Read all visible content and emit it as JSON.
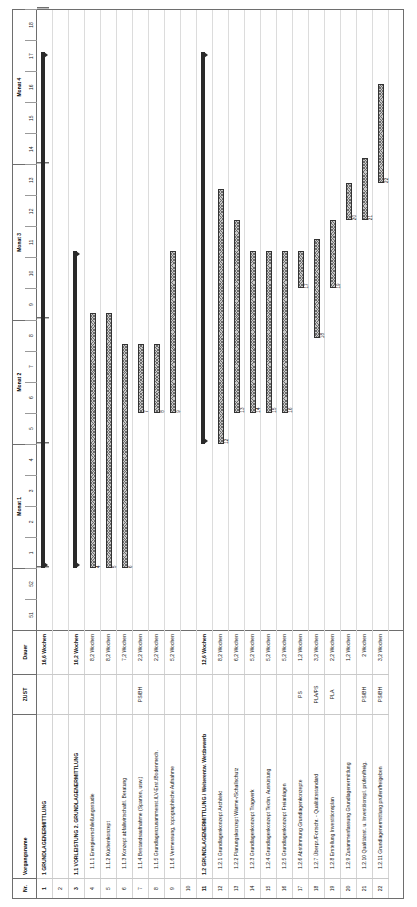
{
  "document": {
    "type": "gantt-chart",
    "orientation": "landscape-rotated-90ccw",
    "language": "de"
  },
  "table": {
    "headers": {
      "nr": "Nr.",
      "vorgangsname": "Vorgangsname",
      "zust": "ZUST",
      "dauer": "Dauer"
    }
  },
  "timeline": {
    "months": [
      {
        "label": "",
        "weeks": 2
      },
      {
        "label": "Monat 1",
        "weeks": 4
      },
      {
        "label": "Monat 2",
        "weeks": 4
      },
      {
        "label": "Monat 3",
        "weeks": 5
      },
      {
        "label": "Monat 4",
        "weeks": 5
      }
    ],
    "weeks": [
      "51",
      "52",
      "1",
      "2",
      "3",
      "4",
      "5",
      "6",
      "7",
      "8",
      "9",
      "10",
      "11",
      "12",
      "13",
      "14",
      "15",
      "16",
      "17",
      "18"
    ]
  },
  "rows": [
    {
      "nr": "1",
      "name": "1 GRUNDLAGENERMITTLUNG",
      "zust": "",
      "dauer": "16,6 Wochen",
      "level": 0,
      "bold": true,
      "bar": {
        "type": "summary",
        "start": 2.0,
        "end": 18.6,
        "label": ""
      }
    },
    {
      "nr": "2",
      "name": "",
      "zust": "",
      "dauer": "",
      "level": 0,
      "bold": false,
      "bar": null
    },
    {
      "nr": "3",
      "name": "1.1 VORLEISTUNG  2. GRUNDLAGENERMITTLUNG",
      "zust": "",
      "dauer": "10,2 Wochen",
      "level": 0,
      "bold": true,
      "bar": {
        "type": "summary",
        "start": 2.0,
        "end": 12.2,
        "label": ""
      }
    },
    {
      "nr": "4",
      "name": "1.1.1 Energieerschließungsstudie",
      "zust": "",
      "dauer": "8,2 Wochen",
      "level": 1,
      "bold": false,
      "bar": {
        "type": "task",
        "start": 2.0,
        "end": 10.2,
        "label": "4"
      }
    },
    {
      "nr": "5",
      "name": "1.1.2 Küchenkonzept",
      "zust": "",
      "dauer": "8,2 Wochen",
      "level": 1,
      "bold": false,
      "bar": {
        "type": "task",
        "start": 2.0,
        "end": 10.2,
        "label": "5"
      }
    },
    {
      "nr": "6",
      "name": "1.1.3 Konzept abfallwirtschaftl. Beratung",
      "zust": "",
      "dauer": "7,2 Wochen",
      "level": 1,
      "bold": false,
      "bar": {
        "type": "task",
        "start": 2.0,
        "end": 9.2,
        "label": "6"
      }
    },
    {
      "nr": "7",
      "name": "1.1.4 Bestandsaufnahme (Sparten, usw.)",
      "zust": "PS/BH",
      "dauer": "2,2 Wochen",
      "level": 1,
      "bold": false,
      "bar": {
        "type": "task",
        "start": 7.0,
        "end": 9.2,
        "label": "7"
      }
    },
    {
      "nr": "8",
      "name": "1.1.5 Grundlagenzusammenst./LV-Erst./Bodenmech.",
      "zust": "",
      "dauer": "2,2 Wochen",
      "level": 1,
      "bold": false,
      "bar": {
        "type": "task",
        "start": 7.0,
        "end": 9.2,
        "label": "8"
      }
    },
    {
      "nr": "9",
      "name": "1.1.6 Vermessung, topographische Aufnahme",
      "zust": "",
      "dauer": "5,2 Wochen",
      "level": 1,
      "bold": false,
      "bar": {
        "type": "task",
        "start": 7.0,
        "end": 12.2,
        "label": "9"
      }
    },
    {
      "nr": "10",
      "name": "",
      "zust": "",
      "dauer": "",
      "level": 0,
      "bold": false,
      "bar": null
    },
    {
      "nr": "11",
      "name": "1.2 GRUNDLAGENERMITTLUNG / Weiterentw. Wettbewerb",
      "zust": "",
      "dauer": "12,6 Wochen",
      "level": 0,
      "bold": true,
      "bar": {
        "type": "summary",
        "start": 6.0,
        "end": 18.6,
        "label": ""
      }
    },
    {
      "nr": "12",
      "name": "1.2.1 Grundlagenkonzept Architekt",
      "zust": "",
      "dauer": "8,2 Wochen",
      "level": 1,
      "bold": false,
      "bar": {
        "type": "task",
        "start": 6.0,
        "end": 14.2,
        "label": "12"
      }
    },
    {
      "nr": "13",
      "name": "1.2.2 Planungskonzept Wärme-/Schallschutz",
      "zust": "",
      "dauer": "6,2 Wochen",
      "level": 1,
      "bold": false,
      "bar": {
        "type": "task",
        "start": 7.0,
        "end": 13.2,
        "label": "13"
      }
    },
    {
      "nr": "14",
      "name": "1.2.3 Grundlagenkonzept Tragwerk",
      "zust": "",
      "dauer": "5,2 Wochen",
      "level": 1,
      "bold": false,
      "bar": {
        "type": "task",
        "start": 7.0,
        "end": 12.2,
        "label": "14"
      }
    },
    {
      "nr": "15",
      "name": "1.2.4 Grundlagenkonzept Techn. Ausrüstung",
      "zust": "",
      "dauer": "5,2 Wochen",
      "level": 1,
      "bold": false,
      "bar": {
        "type": "task",
        "start": 7.0,
        "end": 12.2,
        "label": "15"
      }
    },
    {
      "nr": "16",
      "name": "1.2.5 Grundlagenkonzept Freianlagen",
      "zust": "",
      "dauer": "5,2 Wochen",
      "level": 1,
      "bold": false,
      "bar": {
        "type": "task",
        "start": 7.0,
        "end": 12.2,
        "label": "16"
      }
    },
    {
      "nr": "17",
      "name": "1.2.6 Abstimmung Grundlagenkonzepte",
      "zust": "PS",
      "dauer": "1,2 Wochen",
      "level": 1,
      "bold": false,
      "bar": {
        "type": "task",
        "start": 11.0,
        "end": 12.2,
        "label": "17"
      }
    },
    {
      "nr": "18",
      "name": "1.2.7 Überpr./Fortschr. - Qualitätsstandard",
      "zust": "PLA/PS",
      "dauer": "3,2 Wochen",
      "level": 1,
      "bold": false,
      "bar": {
        "type": "task",
        "start": 9.4,
        "end": 12.6,
        "label": "18"
      }
    },
    {
      "nr": "19",
      "name": "1.2.8 Erstellung Investitionsplan",
      "zust": "PLA",
      "dauer": "2,2 Wochen",
      "level": 1,
      "bold": false,
      "bar": {
        "type": "task",
        "start": 11.0,
        "end": 13.2,
        "label": "19"
      }
    },
    {
      "nr": "20",
      "name": "1.2.9 Zusammenfassung Grundlagenermittlung",
      "zust": "",
      "dauer": "1,2 Wochen",
      "level": 1,
      "bold": false,
      "bar": {
        "type": "task",
        "start": 13.2,
        "end": 14.4,
        "label": "20"
      }
    },
    {
      "nr": "21",
      "name": "1.2.10 Qualitätsst. u. Investitionspl. prüfen/freig.",
      "zust": "PS/BH",
      "dauer": "2 Wochen",
      "level": 1,
      "bold": false,
      "bar": {
        "type": "task",
        "start": 13.2,
        "end": 15.2,
        "label": "21"
      }
    },
    {
      "nr": "22",
      "name": "1.2.11 Grundlagenermittlung prüfen/freigeben",
      "zust": "PS/BH",
      "dauer": "3,2 Wochen",
      "level": 1,
      "bold": false,
      "bar": {
        "type": "task",
        "start": 14.4,
        "end": 17.6,
        "label": "22"
      }
    }
  ],
  "colors": {
    "bar_fill": "#c9c9c9",
    "bar_border": "#333333",
    "summary_bar": "#2a2a2a",
    "grid_line": "#dcdcdc",
    "frame": "#6e6e6e"
  }
}
